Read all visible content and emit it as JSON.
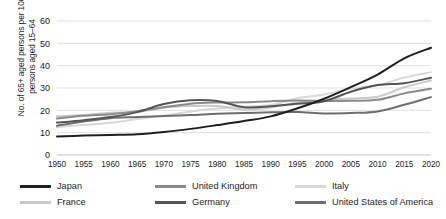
{
  "chart_data": {
    "type": "line",
    "title": "",
    "xlabel": "",
    "ylabel": "No. of 65+ aged persons per 100 persons aged 15–64",
    "x": [
      1950,
      1955,
      1960,
      1965,
      1970,
      1975,
      1980,
      1985,
      1990,
      1995,
      2000,
      2005,
      2010,
      2015,
      2020
    ],
    "xticklabels": [
      "1950",
      "1955",
      "1960",
      "1965",
      "1970",
      "1975",
      "1980",
      "1985",
      "1990",
      "1995",
      "2000",
      "2005",
      "2010",
      "2015",
      "2020"
    ],
    "yticklabels": [
      "0",
      "10",
      "20",
      "30",
      "40",
      "50",
      "60"
    ],
    "ylim": [
      0,
      60
    ],
    "xlim": [
      1950,
      2020
    ],
    "grid": true,
    "legend_position": "bottom",
    "series": [
      {
        "name": "Japan",
        "color": "#1f1f1f",
        "values": [
          8.3,
          8.7,
          9.0,
          9.3,
          10.3,
          11.7,
          13.4,
          15.2,
          17.3,
          20.9,
          25.2,
          30.4,
          36.0,
          43.3,
          48.0
        ]
      },
      {
        "name": "France",
        "color": "#c9c9c9",
        "values": [
          17.3,
          17.9,
          18.9,
          19.2,
          21.2,
          21.9,
          21.9,
          20.4,
          21.3,
          23.4,
          24.6,
          25.3,
          26.1,
          30.3,
          33.4
        ]
      },
      {
        "name": "United Kingdom",
        "color": "#8a8a8a",
        "values": [
          16.3,
          17.6,
          18.3,
          19.6,
          21.4,
          23.0,
          23.5,
          23.6,
          24.1,
          24.4,
          24.2,
          24.3,
          24.7,
          27.6,
          29.7
        ]
      },
      {
        "name": "Germany",
        "color": "#555555",
        "values": [
          14.5,
          15.6,
          17.0,
          19.2,
          22.8,
          24.5,
          24.2,
          21.4,
          21.8,
          22.9,
          24.1,
          28.3,
          31.3,
          32.1,
          34.6
        ]
      },
      {
        "name": "Italy",
        "color": "#d8d8d8",
        "values": [
          12.5,
          13.5,
          14.4,
          16.1,
          17.6,
          19.5,
          20.8,
          21.6,
          22.4,
          25.4,
          27.1,
          29.7,
          31.2,
          34.7,
          37.1
        ]
      },
      {
        "name": "United States of America",
        "color": "#6e6e6e",
        "values": [
          13.1,
          15.0,
          16.5,
          17.0,
          17.5,
          17.9,
          18.5,
          18.8,
          19.1,
          19.2,
          18.6,
          18.8,
          19.5,
          22.5,
          25.9
        ]
      }
    ]
  },
  "legend": {
    "rows": [
      [
        {
          "label": "Japan",
          "color": "#1f1f1f"
        },
        {
          "label": "United Kingdom",
          "color": "#8a8a8a"
        },
        {
          "label": "Italy",
          "color": "#d8d8d8"
        }
      ],
      [
        {
          "label": "France",
          "color": "#c9c9c9"
        },
        {
          "label": "Germany",
          "color": "#555555"
        },
        {
          "label": "United States of America",
          "color": "#6e6e6e"
        }
      ]
    ]
  }
}
